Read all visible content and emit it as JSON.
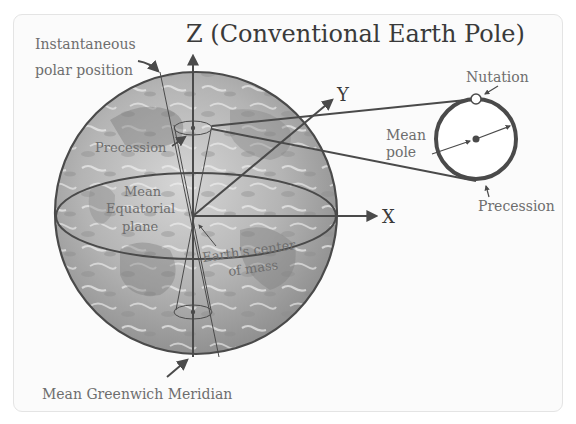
{
  "diagram": {
    "title": "Z (Conventional Earth Pole)",
    "axes": {
      "z_label": "Z (Conventional Earth Pole)",
      "y_label": "Y",
      "x_label": "X"
    },
    "labels": {
      "instantaneous_line1": "Instantaneous",
      "instantaneous_line2": "polar position",
      "precession_left": "Precession",
      "mean_equatorial_line1": "Mean",
      "mean_equatorial_line2": "Equatorial",
      "mean_equatorial_line3": "plane",
      "center_line1": "Earth's center",
      "center_line2": "of mass",
      "greenwich": "Mean Greenwich Meridian",
      "nutation": "Nutation",
      "mean_pole_line1": "Mean",
      "mean_pole_line2": "pole",
      "precession_right": "Precession"
    },
    "colors": {
      "line": "#4a4a4a",
      "label": "#6e6e6e",
      "earth_light": "#c8c8c8",
      "earth_dark": "#7a7a7a",
      "frame_bg": "#fbfbfb"
    }
  }
}
